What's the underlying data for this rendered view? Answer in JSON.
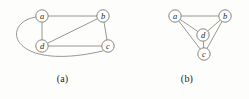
{
  "figure": {
    "background_color": "#fdfdfc",
    "edge_color": "#8a8a86",
    "node_fill": "#ffffff",
    "node_stroke": "#77776f",
    "label_color": "#1d1d1b"
  },
  "panels": [
    {
      "id": "a",
      "caption": "(a)",
      "node_radius": 6.2,
      "nodes": [
        {
          "id": "a",
          "label": "a",
          "x": 42,
          "y": 16
        },
        {
          "id": "b",
          "label": "b",
          "x": 103,
          "y": 16
        },
        {
          "id": "c",
          "label": "c",
          "x": 108,
          "y": 46
        },
        {
          "id": "d",
          "label": "d",
          "x": 42,
          "y": 46
        }
      ],
      "edges": [
        {
          "from": "a",
          "to": "b",
          "shape": "straight"
        },
        {
          "from": "a",
          "to": "d",
          "shape": "straight"
        },
        {
          "from": "b",
          "to": "c",
          "shape": "straight"
        },
        {
          "from": "b",
          "to": "d",
          "shape": "straight"
        },
        {
          "from": "c",
          "to": "d",
          "shape": "straight"
        },
        {
          "from": "a",
          "to": "c",
          "shape": "curved"
        }
      ],
      "edge_count": 6,
      "vertex_count": 4
    },
    {
      "id": "b",
      "caption": "(b)",
      "node_radius": 6.2,
      "nodes": [
        {
          "id": "a",
          "label": "a",
          "x": 50,
          "y": 16
        },
        {
          "id": "b",
          "label": "b",
          "x": 100,
          "y": 16
        },
        {
          "id": "c",
          "label": "c",
          "x": 79,
          "y": 54
        },
        {
          "id": "d",
          "label": "d",
          "x": 78,
          "y": 35
        }
      ],
      "edges": [
        {
          "from": "a",
          "to": "b",
          "shape": "straight"
        },
        {
          "from": "a",
          "to": "d",
          "shape": "straight"
        },
        {
          "from": "a",
          "to": "c",
          "shape": "straight"
        },
        {
          "from": "b",
          "to": "d",
          "shape": "straight"
        },
        {
          "from": "b",
          "to": "c",
          "shape": "straight"
        },
        {
          "from": "c",
          "to": "d",
          "shape": "straight"
        }
      ],
      "edge_count": 6,
      "vertex_count": 4
    }
  ]
}
